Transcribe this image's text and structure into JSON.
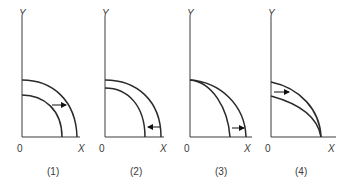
{
  "figure": {
    "type": "production-possibilities-frontier shifts",
    "panels": [
      {
        "caption": "(1)",
        "y_label": "Y",
        "x_label": "X",
        "origin_label": "0",
        "shift": "outward parallel shift (both X and Y increase)",
        "arrow_direction": "right"
      },
      {
        "caption": "(2)",
        "y_label": "Y",
        "x_label": "X",
        "origin_label": "0",
        "shift": "inward parallel shift (both X and Y decrease)",
        "arrow_direction": "left"
      },
      {
        "caption": "(3)",
        "y_label": "Y",
        "x_label": "X",
        "origin_label": "0",
        "shift": "X-intercept increases, Y-intercept unchanged",
        "arrow_direction": "right"
      },
      {
        "caption": "(4)",
        "y_label": "Y",
        "x_label": "X",
        "origin_label": "0",
        "shift": "Y-intercept increases, X-intercept unchanged",
        "arrow_direction": "right"
      }
    ]
  },
  "colors": {
    "line": "#2a2a2a",
    "text": "#3a3a3a",
    "background": "#ffffff"
  }
}
